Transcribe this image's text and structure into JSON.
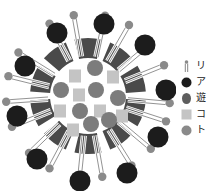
{
  "diagram": {
    "title": "",
    "center": [
      88,
      96
    ],
    "colors": {
      "background": "#ffffff",
      "ring_wedge": "#4a4a4a",
      "dark_circle": "#1c1c1c",
      "mid_circle": "#7c7c7c",
      "light_square": "#c4c4c4",
      "head_circle": "#8a8a8a",
      "tail_stroke": "#777777"
    },
    "inner_core_radius": 37,
    "ring": {
      "inner_radius": 38,
      "outer_radius": 58,
      "wedges": 10
    },
    "outer_dark_circles": [
      {
        "x": 57,
        "y": 33
      },
      {
        "x": 104,
        "y": 24
      },
      {
        "x": 145,
        "y": 45
      },
      {
        "x": 166,
        "y": 90
      },
      {
        "x": 158,
        "y": 137
      },
      {
        "x": 127,
        "y": 173
      },
      {
        "x": 80,
        "y": 181
      },
      {
        "x": 37,
        "y": 159
      },
      {
        "x": 17,
        "y": 116
      },
      {
        "x": 25,
        "y": 66
      }
    ],
    "lipids": [
      {
        "angle": -118
      },
      {
        "angle": -100
      },
      {
        "angle": -78
      },
      {
        "angle": -60
      },
      {
        "angle": -40
      },
      {
        "angle": -22
      },
      {
        "angle": 5
      },
      {
        "angle": 18
      },
      {
        "angle": 40
      },
      {
        "angle": 58
      },
      {
        "angle": 80
      },
      {
        "angle": 96
      },
      {
        "angle": 118
      },
      {
        "angle": 136
      },
      {
        "angle": 158
      },
      {
        "angle": 176
      },
      {
        "angle": 194
      },
      {
        "angle": 212
      }
    ],
    "inner_circles": [
      {
        "x": 95,
        "y": 68
      },
      {
        "x": 61,
        "y": 90
      },
      {
        "x": 96,
        "y": 90
      },
      {
        "x": 118,
        "y": 98
      },
      {
        "x": 80,
        "y": 111
      },
      {
        "x": 91,
        "y": 124
      },
      {
        "x": 109,
        "y": 120
      }
    ],
    "inner_squares": [
      {
        "x": 75,
        "y": 76
      },
      {
        "x": 113,
        "y": 77
      },
      {
        "x": 79,
        "y": 95
      },
      {
        "x": 60,
        "y": 111
      },
      {
        "x": 100,
        "y": 111
      },
      {
        "x": 122,
        "y": 116
      },
      {
        "x": 73,
        "y": 130
      }
    ]
  },
  "legend": {
    "items": [
      {
        "icon": "lipid-hairpin-icon",
        "label": "リ"
      },
      {
        "icon": "dark-circle-icon",
        "label": "ア"
      },
      {
        "icon": "mid-circle-icon",
        "label": "遊"
      },
      {
        "icon": "light-square-icon",
        "label": "コ"
      },
      {
        "icon": "gray-circle-icon",
        "label": "ト"
      }
    ]
  }
}
